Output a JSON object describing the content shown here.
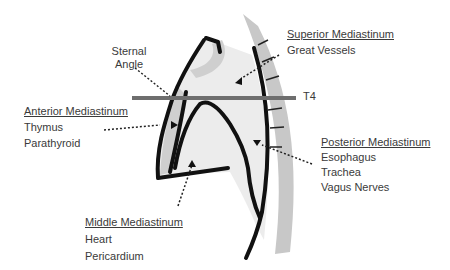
{
  "labels": {
    "sternal_angle": {
      "line1": "Sternal",
      "line2": "Angle"
    },
    "t4": "T4",
    "superior": {
      "title": "Superior Mediastinum",
      "items": [
        "Great Vessels"
      ]
    },
    "anterior": {
      "title": "Anterior Mediastinum",
      "items": [
        "Thymus",
        "Parathyroid"
      ]
    },
    "posterior": {
      "title": "Posterior Mediastinum",
      "items": [
        "Esophagus",
        "Trachea",
        "Vagus Nerves"
      ]
    },
    "middle": {
      "title": "Middle Mediastinum",
      "items": [
        "Heart",
        "Pericardium"
      ]
    }
  },
  "colors": {
    "outline": "#111111",
    "spine_band": "#c8c8c8",
    "inner_fill": "#ececec",
    "t4_line": "#6e6e6e",
    "text": "#3a3a3a"
  }
}
